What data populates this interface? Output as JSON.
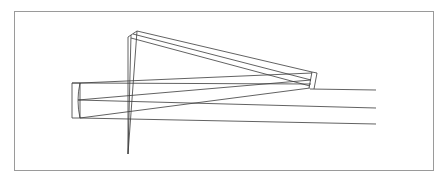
{
  "diagram": {
    "type": "optical-ray-trace",
    "frame": {
      "x": 14.5,
      "y": 11.5,
      "w": 419,
      "h": 159,
      "stroke": "#9a9a9a"
    },
    "stroke_color": "#3a3a3a",
    "elements": {
      "primary_mirror": {
        "box": [
          [
            72,
            83
          ],
          [
            80,
            83
          ],
          [
            80,
            118
          ],
          [
            72,
            118
          ]
        ],
        "surface": "M80,83 Q76,100.5 80,118"
      },
      "fold_mirror": {
        "lines": [
          [
            [
              128,
              37
            ],
            [
              137,
              31
            ]
          ],
          [
            [
              128,
              37
            ],
            [
              128,
              154
            ]
          ],
          [
            [
              131,
              35
            ],
            [
              128,
              154
            ]
          ],
          [
            [
              137,
              31
            ],
            [
              128,
              154
            ]
          ]
        ]
      },
      "secondary_mirror": {
        "lines": [
          [
            [
              312,
              72
            ],
            [
              317,
              73
            ]
          ],
          [
            [
              317,
              73
            ],
            [
              314,
              89
            ]
          ],
          [
            [
              312,
              72
            ],
            [
              309,
              88
            ]
          ]
        ]
      }
    },
    "rays": [
      [
        [
          137,
          31
        ],
        [
          312,
          72
        ]
      ],
      [
        [
          133,
          34
        ],
        [
          311,
          80
        ]
      ],
      [
        [
          131,
          38
        ],
        [
          310,
          86
        ]
      ],
      [
        [
          80,
          83
        ],
        [
          312,
          73
        ]
      ],
      [
        [
          80,
          83
        ],
        [
          311,
          84
        ]
      ],
      [
        [
          78,
          100
        ],
        [
          311,
          80
        ]
      ],
      [
        [
          78,
          100
        ],
        [
          376,
          108
        ]
      ],
      [
        [
          80,
          118
        ],
        [
          310,
          88
        ]
      ],
      [
        [
          80,
          118
        ],
        [
          376,
          124
        ]
      ],
      [
        [
          310,
          89
        ],
        [
          376,
          90
        ]
      ],
      [
        [
          72,
          83
        ],
        [
          80,
          83
        ]
      ]
    ]
  }
}
